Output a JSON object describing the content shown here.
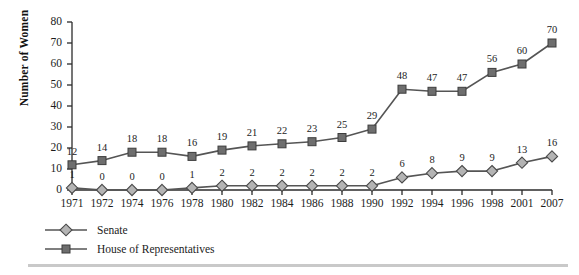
{
  "chart_data": {
    "type": "line",
    "title": "",
    "subtitle": "",
    "xlabel": "",
    "ylabel": "Number of Women",
    "categories": [
      "1971",
      "1972",
      "1974",
      "1976",
      "1978",
      "1980",
      "1982",
      "1984",
      "1986",
      "1988",
      "1990",
      "1992",
      "1994",
      "1996",
      "1998",
      "2001",
      "2007"
    ],
    "series": [
      {
        "name": "Senate",
        "marker": "diamond",
        "color": "#a8a8a8",
        "line_color": "#555555",
        "values": [
          1,
          0,
          0,
          0,
          1,
          2,
          2,
          2,
          2,
          2,
          2,
          6,
          8,
          9,
          9,
          13,
          16
        ]
      },
      {
        "name": "House of Representatives",
        "marker": "square",
        "color": "#6e6e6e",
        "line_color": "#555555",
        "values": [
          12,
          14,
          18,
          18,
          16,
          19,
          21,
          22,
          23,
          25,
          29,
          48,
          47,
          47,
          56,
          60,
          70
        ]
      }
    ],
    "ylim": [
      0,
      80
    ],
    "yticks": [
      0,
      10,
      20,
      30,
      40,
      50,
      60,
      70,
      80
    ],
    "ytick_labels": [
      "0",
      "10",
      "20",
      "30",
      "40",
      "50",
      "60",
      "70",
      "80"
    ],
    "grid": false,
    "legend_position": "below-left",
    "data_labels": true
  },
  "legend": {
    "items": [
      {
        "label": "Senate"
      },
      {
        "label": "House of Representatives"
      }
    ]
  },
  "colors": {
    "axis": "#2b2b2b",
    "senate_marker": "#a8a8a8",
    "house_marker": "#6e6e6e",
    "line": "#555555",
    "rule": "#c9c9c9",
    "background": "#ffffff"
  }
}
